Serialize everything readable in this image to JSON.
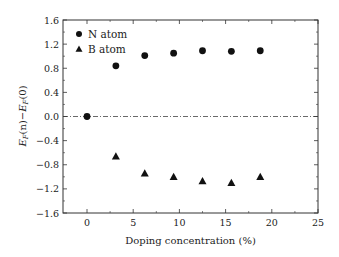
{
  "chart_data": {
    "type": "scatter",
    "title": "",
    "xlabel": "Doping concentration (%)",
    "ylabel": "E_F(n)−E_F(0)",
    "xlim": [
      -2.6,
      25
    ],
    "ylim": [
      -1.6,
      1.6
    ],
    "xticks": [
      0,
      5,
      10,
      15,
      20,
      25
    ],
    "xtick_labels": [
      "0",
      "5",
      "10",
      "15",
      "20",
      "25"
    ],
    "yticks": [
      1.6,
      1.2,
      0.8,
      0.4,
      0.0,
      -0.4,
      -0.8,
      -1.2,
      -1.6
    ],
    "ytick_labels": [
      "1.6",
      "1.2",
      "0.8",
      "0.4",
      "0.0",
      "−0.4",
      "−0.8",
      "−1.2",
      "−1.6"
    ],
    "grid": false,
    "legend_position": "upper left",
    "reference_line": {
      "y": 0.0,
      "style": "dash-dot"
    },
    "series": [
      {
        "name": "N atom",
        "marker": "circle",
        "color": "#111111",
        "x": [
          0,
          3.125,
          6.25,
          9.375,
          12.5,
          15.625,
          18.75
        ],
        "y": [
          0.0,
          0.84,
          1.01,
          1.05,
          1.09,
          1.08,
          1.09
        ]
      },
      {
        "name": "B atom",
        "marker": "triangle",
        "color": "#111111",
        "x": [
          3.125,
          6.25,
          9.375,
          12.5,
          15.625,
          18.75
        ],
        "y": [
          -0.66,
          -0.94,
          -1.0,
          -1.07,
          -1.1,
          -1.0
        ]
      }
    ]
  },
  "legend": {
    "items": [
      {
        "label": "N atom",
        "marker": "circle"
      },
      {
        "label": "B atom",
        "marker": "triangle"
      }
    ]
  },
  "axes": {
    "xlabel": "Doping concentration (%)",
    "ylabel_main": "E",
    "ylabel_sub": "F",
    "ylabel_mid": "(n)−",
    "ylabel_main2": "E",
    "ylabel_sub2": "F",
    "ylabel_end": "(0)"
  }
}
